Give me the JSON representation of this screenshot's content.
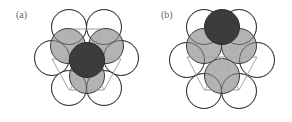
{
  "figure": {
    "colors": {
      "background": "#ffffff",
      "circle_stroke": "#3a3a3a",
      "empty_fill": "#ffffff",
      "gray_fill": "#a6a6a6",
      "dark_fill": "#3c3c3c",
      "lattice_line": "#b0b0b0"
    },
    "panels": [
      {
        "label": "(a)",
        "label_pos": {
          "x": 16,
          "y": 10
        },
        "radius": 17.5,
        "lattice": [
          "M52,59 L121,59",
          "M52,59 L69,90 L104,90 L121,59",
          "M69,29 L104,29",
          "M69,29 L86,59 L104,29",
          "M87,59 L70,90",
          "M87,59 L104,90"
        ],
        "layer_white": [
          {
            "cx": 69,
            "cy": 27
          },
          {
            "cx": 104,
            "cy": 27
          },
          {
            "cx": 52,
            "cy": 58
          },
          {
            "cx": 121,
            "cy": 58
          },
          {
            "cx": 69,
            "cy": 88
          },
          {
            "cx": 104,
            "cy": 88
          }
        ],
        "layer_gray": [
          {
            "cx": 68,
            "cy": 46
          },
          {
            "cx": 106,
            "cy": 46
          },
          {
            "cx": 87,
            "cy": 76
          }
        ],
        "layer_dark": [
          {
            "cx": 87,
            "cy": 60
          }
        ]
      },
      {
        "label": "(b)",
        "label_pos": {
          "x": 161,
          "y": 10
        },
        "radius": 17.5,
        "lattice": [
          "M187,57 L257,57",
          "M187,57 L204,90 L239,90 L257,57",
          "M204,29 L239,29",
          "M222,58 L205,90",
          "M222,58 L239,90"
        ],
        "layer_white": [
          {
            "cx": 204,
            "cy": 27
          },
          {
            "cx": 239,
            "cy": 27
          },
          {
            "cx": 187,
            "cy": 60
          },
          {
            "cx": 257,
            "cy": 60
          },
          {
            "cx": 204,
            "cy": 91
          },
          {
            "cx": 239,
            "cy": 91
          }
        ],
        "layer_gray": [
          {
            "cx": 204,
            "cy": 46
          },
          {
            "cx": 239,
            "cy": 46
          },
          {
            "cx": 222,
            "cy": 76
          }
        ],
        "layer_dark": [
          {
            "cx": 222,
            "cy": 27
          }
        ]
      }
    ]
  }
}
